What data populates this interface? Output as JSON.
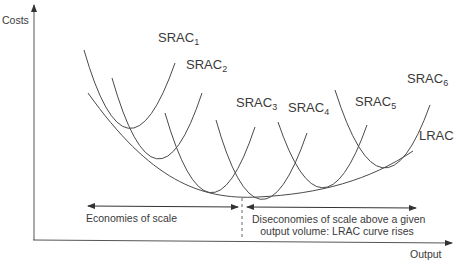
{
  "axes": {
    "y_label": "Costs",
    "x_label": "Output"
  },
  "curves": [
    {
      "name": "SRAC",
      "subscript": "1",
      "label_x": 158,
      "label_y": 44,
      "path": "M84,50 Q127,200 175,63"
    },
    {
      "name": "SRAC",
      "subscript": "2",
      "label_x": 186,
      "label_y": 71,
      "path": "M112,78 Q156,232 202,93"
    },
    {
      "name": "SRAC",
      "subscript": "3",
      "label_x": 236,
      "label_y": 109,
      "path": "M165,113 Q209,265 255,127"
    },
    {
      "name": "SRAC",
      "subscript": "4",
      "label_x": 288,
      "label_y": 114,
      "path": "M216,120 Q259,272 307,133"
    },
    {
      "name": "SRAC",
      "subscript": "5",
      "label_x": 355,
      "label_y": 108,
      "path": "M278,122 Q322,252 367,125"
    },
    {
      "name": "SRAC",
      "subscript": "6",
      "label_x": 407,
      "label_y": 85,
      "path": "M335,90 Q382,238 430,105"
    }
  ],
  "lrac": {
    "label": "LRAC",
    "label_x": 419,
    "label_y": 141,
    "path": "M88,93 C150,180 200,200 258,197 C320,194 370,180 413,151"
  },
  "annotations": {
    "economies": "Economies of scale",
    "diseconomies_line1": "Diseconomies of scale above a given",
    "diseconomies_line2": "output volume: LRAC curve rises"
  },
  "colors": {
    "line": "#4a4a4a",
    "text": "#3a3a3a",
    "background": "#ffffff"
  }
}
